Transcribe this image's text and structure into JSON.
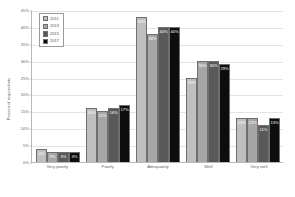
{
  "chart_data": {
    "type": "bar",
    "title": "",
    "xlabel": "",
    "ylabel": "Percent of respondents",
    "ylim": [
      0,
      45
    ],
    "ytick_step": 5,
    "grid": true,
    "legend_position": "top-left",
    "categories": [
      "Very poorly",
      "Poorly",
      "Adequately",
      "Well",
      "Very well"
    ],
    "ytick_labels": [
      "0%",
      "5%",
      "10%",
      "15%",
      "20%",
      "25%",
      "30%",
      "35%",
      "40%",
      "45%"
    ],
    "series": [
      {
        "name": "2011",
        "color": "#bfbfbf",
        "values": [
          4,
          16,
          43,
          25,
          13
        ],
        "labels": [
          "4%",
          "16%",
          "43%",
          "25%",
          "13%"
        ]
      },
      {
        "name": "2013",
        "color": "#a6a6a6",
        "values": [
          3,
          15,
          38,
          30,
          13
        ],
        "labels": [
          "3%",
          "15%",
          "38%",
          "30%",
          "13%"
        ]
      },
      {
        "name": "2015",
        "color": "#595959",
        "values": [
          3,
          16,
          40,
          30,
          11
        ],
        "labels": [
          "3%",
          "16%",
          "40%",
          "30%",
          "11%"
        ]
      },
      {
        "name": "2017",
        "color": "#0d0d0d",
        "values": [
          3,
          17,
          40,
          29,
          13
        ],
        "labels": [
          "3%",
          "17%",
          "40%",
          "29%",
          "13%"
        ]
      }
    ]
  }
}
